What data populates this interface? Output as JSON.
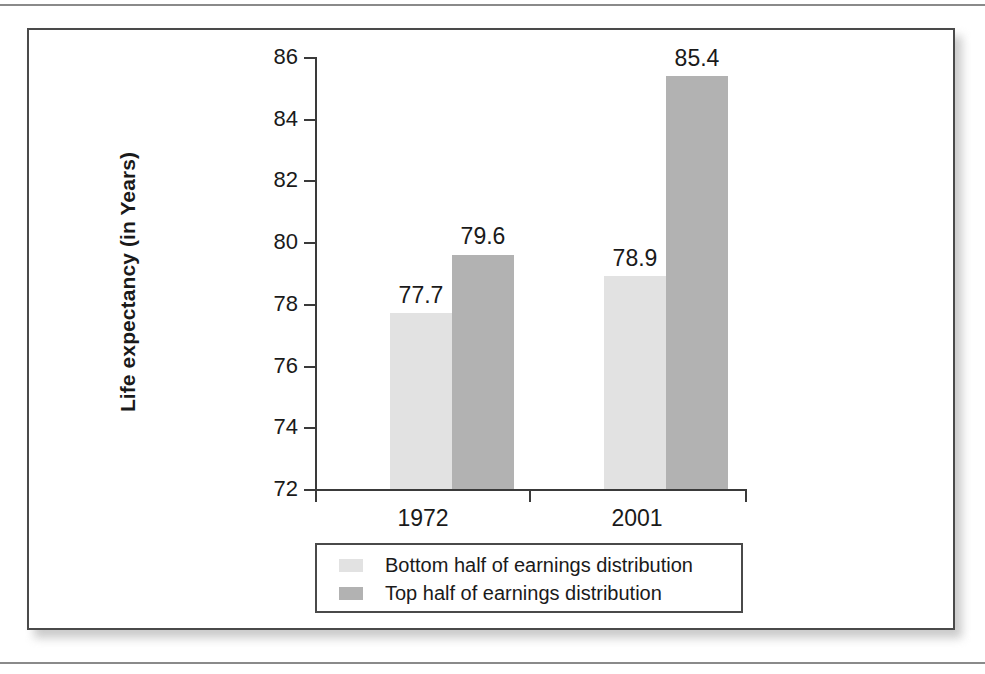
{
  "figure": {
    "frame_border_color": "#4a4a4a"
  },
  "chart_data": {
    "type": "bar",
    "title": "",
    "xlabel": "",
    "ylabel": "Life expectancy (in Years)",
    "categories": [
      "1972",
      "2001"
    ],
    "series": [
      {
        "name": "Bottom half of earnings distribution",
        "color": "#e2e2e2",
        "values": [
          77.7,
          78.9
        ]
      },
      {
        "name": "Top half of earnings distribution",
        "color": "#b2b2b2",
        "values": [
          79.6,
          85.4
        ]
      }
    ],
    "bars": [
      {
        "category": "1972",
        "series": "Bottom half of earnings distribution",
        "value": 77.7,
        "label": "77.7",
        "color": "#e2e2e2"
      },
      {
        "category": "1972",
        "series": "Top half of earnings distribution",
        "value": 78.9,
        "label": "78.9",
        "color": "#b2b2b2"
      },
      {
        "category": "2001",
        "series": "Bottom half of earnings distribution",
        "value": 79.6,
        "label": "79.6",
        "color": "#e2e2e2"
      },
      {
        "category": "2001",
        "series": "Top half of earnings distribution",
        "value": 85.4,
        "label": "85.4",
        "color": "#b2b2b2"
      }
    ],
    "ylim": [
      72,
      86
    ],
    "yticks": [
      86,
      84,
      82,
      80,
      78,
      76,
      74,
      72
    ],
    "ytick_labels": [
      "86",
      "84",
      "82",
      "80",
      "78",
      "76",
      "74",
      "72"
    ],
    "grid": false,
    "legend_position": "below-plot",
    "legend": [
      {
        "label": "Bottom half of earnings distribution",
        "color": "#e2e2e2"
      },
      {
        "label": "Top half of earnings distribution",
        "color": "#b2b2b2"
      }
    ]
  }
}
